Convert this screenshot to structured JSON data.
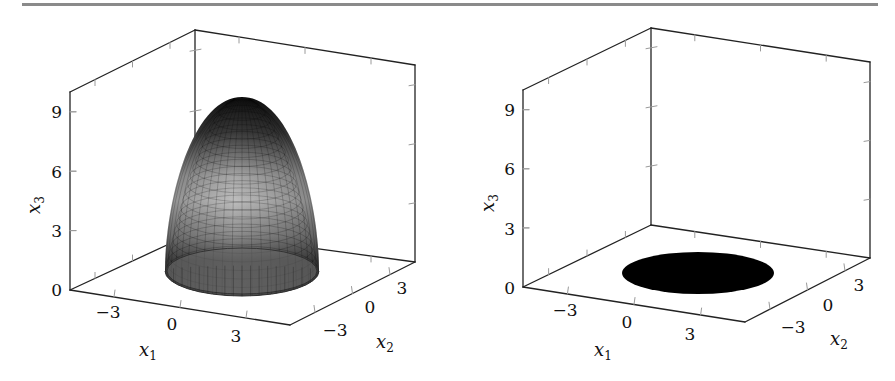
{
  "figure": {
    "rule_color": "#8a8a8a",
    "axis_color": "#222222",
    "tick_color": "#9a9a9a"
  },
  "chart_data": [
    {
      "type": "surface3d",
      "title": "",
      "description": "Paraboloid surface x3 = 10 - (x1^2 + x2^2) (approx.) over a disk, mesh-shaded grayscale",
      "xlabel": "x1",
      "ylabel": "x2",
      "zlabel": "x3",
      "x_ticks": [
        "−3",
        "0",
        "3"
      ],
      "y_ticks": [
        "−3",
        "0",
        "3"
      ],
      "z_ticks": [
        "0",
        "3",
        "6",
        "9"
      ],
      "xlim": [
        -5,
        5
      ],
      "ylim": [
        -5,
        5
      ],
      "zlim": [
        0,
        10
      ],
      "surface": {
        "apex_z": 9.7,
        "base_z": 0,
        "base_radius": 3.2,
        "colormap": "gray",
        "mesh": true
      },
      "geom": {
        "back_left_top": [
          70,
          92
        ],
        "back_center_top": [
          195,
          30
        ],
        "back_right_top": [
          415,
          65
        ],
        "origin": [
          70,
          290
        ],
        "back_center_bottom": [
          195,
          232
        ],
        "back_right_bottom": [
          415,
          262
        ],
        "front_corner": [
          290,
          325
        ],
        "apex": [
          242,
          97
        ],
        "base_center": [
          242,
          271
        ],
        "base_rx": 77,
        "base_ry": 25
      },
      "labels": {
        "z_ticks_pos": [
          [
            62,
            296
          ],
          [
            62,
            237
          ],
          [
            62,
            178
          ],
          [
            62,
            118
          ]
        ],
        "x_ticks_pos": [
          [
            108,
            318
          ],
          [
            172,
            330
          ],
          [
            236,
            342
          ]
        ],
        "y_ticks_pos": [
          [
            335,
            336
          ],
          [
            370,
            313
          ],
          [
            402,
            294
          ]
        ],
        "xlabel_pos": [
          148,
          356
        ],
        "ylabel_pos": [
          385,
          348
        ],
        "zlabel_pos": [
          40,
          205
        ]
      }
    },
    {
      "type": "surface3d",
      "title": "",
      "description": "Filled black disk in the x3 = 0 plane",
      "xlabel": "x1",
      "ylabel": "x2",
      "zlabel": "x3",
      "x_ticks": [
        "−3",
        "0",
        "3"
      ],
      "y_ticks": [
        "−3",
        "0",
        "3"
      ],
      "z_ticks": [
        "0",
        "3",
        "6",
        "9"
      ],
      "xlim": [
        -5,
        5
      ],
      "ylim": [
        -5,
        5
      ],
      "zlim": [
        0,
        10
      ],
      "surface": {
        "disk_z": 0,
        "disk_radius": 3.2,
        "fill": "#000000"
      },
      "geom": {
        "back_left_top": [
          523,
          90
        ],
        "back_center_top": [
          651,
          28
        ],
        "back_right_top": [
          870,
          62
        ],
        "origin": [
          523,
          287
        ],
        "back_center_bottom": [
          651,
          225
        ],
        "back_right_bottom": [
          870,
          258
        ],
        "front_corner": [
          745,
          322
        ],
        "disk_center": [
          698,
          273
        ],
        "disk_rx": 76,
        "disk_ry": 21
      },
      "labels": {
        "z_ticks_pos": [
          [
            515,
            294
          ],
          [
            515,
            235
          ],
          [
            515,
            175
          ],
          [
            515,
            116
          ]
        ],
        "x_ticks_pos": [
          [
            565,
            316
          ],
          [
            627,
            328
          ],
          [
            690,
            340
          ]
        ],
        "y_ticks_pos": [
          [
            793,
            333
          ],
          [
            828,
            311
          ],
          [
            859,
            291
          ]
        ],
        "xlabel_pos": [
          603,
          356
        ],
        "ylabel_pos": [
          839,
          345
        ],
        "zlabel_pos": [
          494,
          203
        ]
      }
    }
  ]
}
